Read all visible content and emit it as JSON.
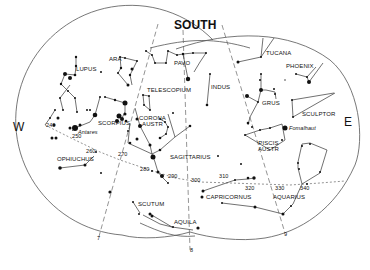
{
  "chart": {
    "title": "SOUTH",
    "directions": {
      "west": "W",
      "east": "E",
      "south": "SOUTH"
    },
    "constellations": [
      "LUPUS",
      "ARA",
      "PAVO",
      "TUCANA",
      "PHOENIX",
      "INDUS",
      "TELESCOPIUM",
      "GRUS",
      "SCULPTOR",
      "CORONA AUSTR",
      "SCORPIUS",
      "OPHIUCHUS",
      "SAGITTARIUS",
      "PISCIS AUSTR",
      "CAPRICORNUS",
      "AQUARIUS",
      "SCUTUM",
      "AQUILA"
    ],
    "stars": [
      "Antares",
      "Fomalhaut"
    ],
    "ecliptic_marks": [
      "240",
      "250",
      "260",
      "270",
      "280",
      "290",
      "300",
      "310",
      "320",
      "330",
      "340"
    ],
    "meridian_marks": [
      "7",
      "8",
      "9"
    ]
  },
  "labels": {
    "lupus": "LUPUS",
    "ara": "ARA",
    "pavo": "PAVO",
    "tucana": "TUCANA",
    "phoenix": "PHOENIX",
    "indus": "INDUS",
    "telescopium": "TELESCOPIUM",
    "grus": "GRUS",
    "sculptor": "SCULPTOR",
    "corona1": "CORONA",
    "corona2": "AUSTR",
    "scorpius": "SCORPIUS",
    "ophiuchus": "OPHIUCHUS",
    "sagittarius": "SAGITTARIUS",
    "piscis1": "PISCIS",
    "piscis2": "AUSTR",
    "capricornus": "CAPRICORNUS",
    "aquarius": "AQUARIUS",
    "scutum": "SCUTUM",
    "aquila": "AQUILA",
    "antares": "Antares",
    "fomalhaut": "Fomalhaut",
    "e240": "240",
    "e250": "250",
    "e260": "260",
    "e270": "270",
    "e280": "280",
    "e290": "290",
    "e300": "300",
    "e310": "310",
    "e320": "320",
    "e330": "330",
    "e340": "340",
    "m7": "7",
    "m8": "8",
    "m9": "9",
    "west": "W",
    "east": "E",
    "south": "SOUTH"
  }
}
